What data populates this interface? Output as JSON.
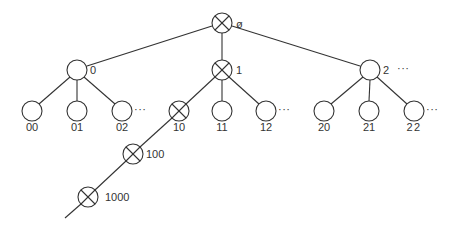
{
  "diagram": {
    "type": "tree",
    "colors": {
      "stroke": "#333333",
      "background": "#ffffff"
    },
    "root": {
      "id": "root",
      "label": "ø",
      "crossed": true
    },
    "nodes": [
      {
        "id": "root",
        "label": "ø",
        "crossed": true,
        "x": 222,
        "y": 23
      },
      {
        "id": "0",
        "label": "0",
        "crossed": false,
        "x": 77,
        "y": 70
      },
      {
        "id": "1",
        "label": "1",
        "crossed": true,
        "x": 222,
        "y": 70
      },
      {
        "id": "2",
        "label": "2",
        "crossed": false,
        "x": 370,
        "y": 70,
        "ellipsis": "···"
      },
      {
        "id": "00",
        "label": "00",
        "crossed": false,
        "x": 32,
        "y": 111
      },
      {
        "id": "01",
        "label": "01",
        "crossed": false,
        "x": 77,
        "y": 111
      },
      {
        "id": "02",
        "label": "02",
        "crossed": false,
        "x": 122,
        "y": 111,
        "ellipsis": "···"
      },
      {
        "id": "10",
        "label": "10",
        "crossed": true,
        "x": 179,
        "y": 111
      },
      {
        "id": "11",
        "label": "11",
        "crossed": false,
        "x": 222,
        "y": 111
      },
      {
        "id": "12",
        "label": "12",
        "crossed": false,
        "x": 266,
        "y": 111,
        "ellipsis": "···"
      },
      {
        "id": "20",
        "label": "20",
        "crossed": false,
        "x": 324,
        "y": 111
      },
      {
        "id": "21",
        "label": "21",
        "crossed": false,
        "x": 369,
        "y": 111
      },
      {
        "id": "22",
        "label": "22",
        "crossed": false,
        "x": 414,
        "y": 111,
        "ellipsis": "···"
      },
      {
        "id": "100",
        "label": "100",
        "crossed": true,
        "x": 133,
        "y": 154
      },
      {
        "id": "1000",
        "label": "1000",
        "crossed": true,
        "x": 88,
        "y": 197
      }
    ],
    "edges": [
      [
        "root",
        "0"
      ],
      [
        "root",
        "1"
      ],
      [
        "root",
        "2"
      ],
      [
        "0",
        "00"
      ],
      [
        "0",
        "01"
      ],
      [
        "0",
        "02"
      ],
      [
        "1",
        "10"
      ],
      [
        "1",
        "11"
      ],
      [
        "1",
        "12"
      ],
      [
        "2",
        "20"
      ],
      [
        "2",
        "21"
      ],
      [
        "2",
        "22"
      ],
      [
        "10",
        "100"
      ],
      [
        "100",
        "1000"
      ]
    ],
    "continuation": "path continues below node 1000"
  }
}
